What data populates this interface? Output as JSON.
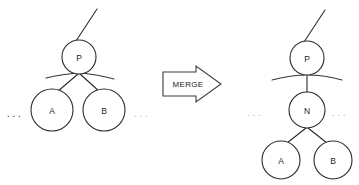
{
  "figure": {
    "background_color": "#ffffff",
    "stroke_color": "#2b2b2b",
    "width": 359,
    "height": 185
  },
  "transition": {
    "label": "MERGE",
    "direction": "left-to-right",
    "arrow_style": "hollow-block-arrow",
    "arrow_fill": "#ffffff",
    "arrow_stroke": "#3c3c3c"
  },
  "before": {
    "caption": "",
    "nodes": [
      {
        "id": "P",
        "label": "P",
        "cx": 79,
        "cy": 57,
        "r": 17
      },
      {
        "id": "A",
        "label": "A",
        "cx": 52,
        "cy": 110,
        "r": 21
      },
      {
        "id": "B",
        "label": "B",
        "cx": 104,
        "cy": 110,
        "r": 21
      }
    ],
    "edges": [
      {
        "from": "parent-above",
        "to": "P"
      },
      {
        "from": "P",
        "to": "A"
      },
      {
        "from": "P",
        "to": "B"
      }
    ],
    "sibling_stubs": 2,
    "ellipses": [
      {
        "position": "left",
        "label": "...",
        "x": 15,
        "y": 113,
        "shade": "strong"
      },
      {
        "position": "right",
        "label": "...",
        "x": 142,
        "y": 113,
        "shade": "faint"
      }
    ]
  },
  "after": {
    "caption": "",
    "nodes": [
      {
        "id": "P",
        "label": "P",
        "cx": 307,
        "cy": 58,
        "r": 17
      },
      {
        "id": "N",
        "label": "N",
        "cx": 307,
        "cy": 110,
        "r": 18
      },
      {
        "id": "A",
        "label": "A",
        "cx": 281,
        "cy": 160,
        "r": 19
      },
      {
        "id": "B",
        "label": "B",
        "cx": 333,
        "cy": 160,
        "r": 19
      }
    ],
    "edges": [
      {
        "from": "parent-above",
        "to": "P"
      },
      {
        "from": "P",
        "to": "N"
      },
      {
        "from": "N",
        "to": "A"
      },
      {
        "from": "N",
        "to": "B"
      }
    ],
    "sibling_stubs": 2,
    "ellipses": [
      {
        "position": "left",
        "label": "...",
        "x": 255,
        "y": 112,
        "shade": "faint"
      },
      {
        "position": "right",
        "label": "...",
        "x": 340,
        "y": 112,
        "shade": "faint"
      }
    ]
  }
}
